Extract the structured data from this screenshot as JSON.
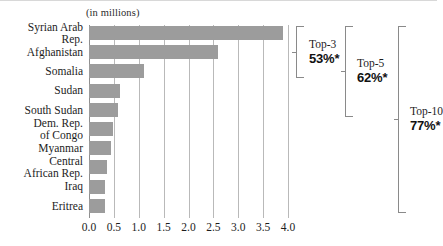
{
  "chart_data": {
    "type": "bar",
    "orientation": "horizontal",
    "title": "",
    "subtitle": "",
    "units_caption": "(in millions)",
    "xlabel": "",
    "ylabel": "",
    "xlim": [
      0.0,
      4.0
    ],
    "grid": true,
    "gridlines_axis": "x",
    "legend": "none",
    "categories": [
      "Syrian Arab Rep.",
      "Afghanistan",
      "Somalia",
      "Sudan",
      "South Sudan",
      "Dem. Rep. of Congo",
      "Myanmar",
      "Central African Rep.",
      "Iraq",
      "Eritrea"
    ],
    "category_lines": [
      [
        "Syrian Arab",
        "Rep."
      ],
      [
        "Afghanistan"
      ],
      [
        "Somalia"
      ],
      [
        "Sudan"
      ],
      [
        "South Sudan"
      ],
      [
        "Dem. Rep.",
        "of Congo"
      ],
      [
        "Myanmar"
      ],
      [
        "Central",
        "African Rep."
      ],
      [
        "Iraq"
      ],
      [
        "Eritrea"
      ]
    ],
    "values": [
      3.9,
      2.6,
      1.1,
      0.62,
      0.58,
      0.48,
      0.45,
      0.37,
      0.32,
      0.32
    ],
    "xticks": [
      0.0,
      0.5,
      1.0,
      1.5,
      2.0,
      2.5,
      3.0,
      3.5,
      4.0
    ],
    "xtick_labels": [
      "0.0",
      "0.5",
      "1.0",
      "1.5",
      "2.0",
      "2.5",
      "3.0",
      "3.5",
      "4.0"
    ],
    "bar_color": "#9c9c9c",
    "gridline_color": "#b9b9b9",
    "annotations": [
      {
        "name": "top-3",
        "title": "Top-3",
        "value": "53%*",
        "covers_categories": [
          0,
          1,
          2
        ]
      },
      {
        "name": "top-5",
        "title": "Top-5",
        "value": "62%*",
        "covers_categories": [
          0,
          1,
          2,
          3,
          4
        ]
      },
      {
        "name": "top-10",
        "title": "Top-10",
        "value": "77%*",
        "covers_categories": [
          0,
          1,
          2,
          3,
          4,
          5,
          6,
          7,
          8,
          9
        ]
      }
    ]
  }
}
